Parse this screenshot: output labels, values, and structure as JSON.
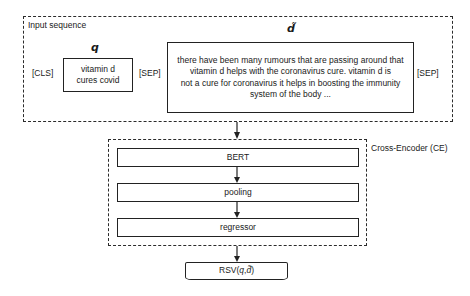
{
  "input_sequence": {
    "label": "Input sequence",
    "cls_token": "[CLS]",
    "sep_token_1": "[SEP]",
    "sep_token_2": "[SEP]",
    "query": {
      "symbol": "q",
      "text": "vitamin d cures covid"
    },
    "document": {
      "symbol": "d̃",
      "lines": [
        "there have been many rumours that are passing around that",
        "vitamin d helps with the coronavirus cure. vitamin d is",
        "not a cure for coronavirus it helps in boosting the immunity",
        "system of the body ..."
      ]
    }
  },
  "cross_encoder": {
    "label": "Cross-Encoder (CE)",
    "layers": [
      {
        "label": "BERT"
      },
      {
        "label": "pooling"
      },
      {
        "label": "regressor"
      }
    ]
  },
  "output": {
    "label": "RSV(q, d̃)",
    "prefix": "RSV(",
    "q": "q",
    "sep": ",",
    "d": "d̃",
    "suffix": ")"
  },
  "colors": {
    "stroke": "#222222",
    "background": "#ffffff",
    "text": "#1a1a1a"
  }
}
